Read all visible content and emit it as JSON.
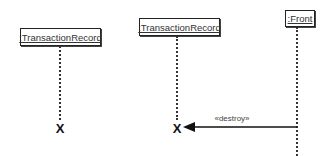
{
  "diagram": {
    "type": "UML sequence diagram",
    "objects": [
      {
        "id": "obj1",
        "label": ":TransactionRecord",
        "destroyed": true,
        "destroy_marker": "X"
      },
      {
        "id": "obj2",
        "label": ":TransactionRecord",
        "destroyed": true,
        "destroy_marker": "X"
      },
      {
        "id": "obj3",
        "label": ":Front",
        "destroyed": false
      }
    ],
    "messages": [
      {
        "from": "obj3",
        "to": "obj2",
        "label": "«destroy»",
        "arrow": "filled"
      }
    ]
  }
}
